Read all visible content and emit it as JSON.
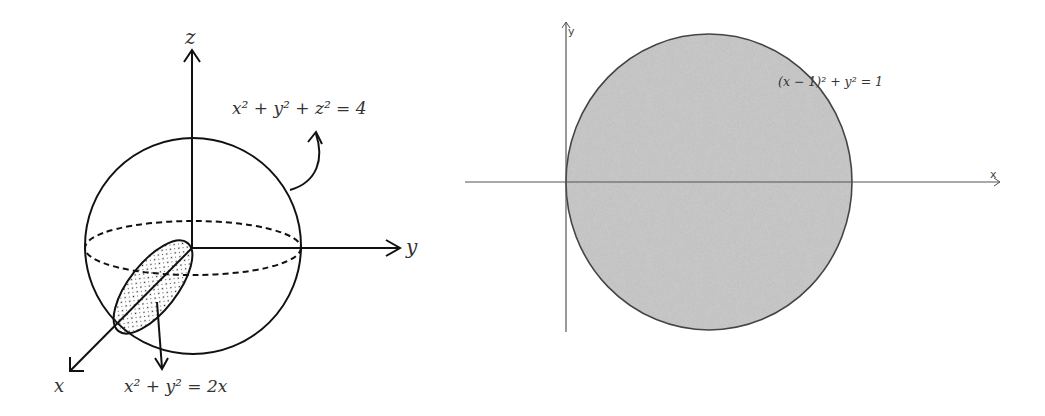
{
  "left_diagram": {
    "title": "3D sphere with cylinder cross-section",
    "axes": {
      "z_label": "z",
      "y_label": "y",
      "x_label": "x"
    },
    "sphere_equation": {
      "text": "x² + y² + z² = 4"
    },
    "cylinder_equation": {
      "text": "x² + y² = 2x"
    }
  },
  "right_diagram": {
    "title": "Projection onto xy-plane",
    "axes": {
      "x_label": "x",
      "y_label": "y"
    },
    "circle_equation": {
      "text": "(x − 1)² + y² = 1"
    },
    "fill_color": "#c8c8c8",
    "stroke_color": "#444444"
  }
}
